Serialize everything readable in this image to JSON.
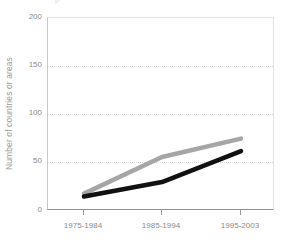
{
  "chart_data": {
    "type": "line",
    "title": "",
    "title_fragment": "р",
    "xlabel": "",
    "ylabel": "Number of countries or areas",
    "categories": [
      "1975-1984",
      "1985-1994",
      "1995-2003"
    ],
    "ylim": [
      0,
      200
    ],
    "yticks": [
      0,
      50,
      100,
      150,
      200
    ],
    "ytick_labels": [
      "0",
      "50",
      "100",
      "150",
      "200"
    ],
    "grid": true,
    "grid_style": "dotted-horizontal",
    "legend": "none",
    "series": [
      {
        "name": "gray-series",
        "color": "#a6a6a6",
        "values": [
          18,
          56,
          75
        ]
      },
      {
        "name": "black-series",
        "color": "#111111",
        "values": [
          15,
          30,
          62
        ]
      }
    ]
  },
  "axes": {
    "y_axis_title": "Number of countries or areas",
    "y_tick_0": "0",
    "y_tick_1": "50",
    "y_tick_2": "100",
    "y_tick_3": "150",
    "y_tick_4": "200",
    "x_tick_0": "1975-1984",
    "x_tick_1": "1985-1994",
    "x_tick_2": "1995-2003"
  },
  "colors": {
    "series_gray": "#a6a6a6",
    "series_black": "#111111",
    "grid": "#d9d9d9",
    "axis": "#8f8f8f",
    "tick_text": "#8a8a8a"
  }
}
